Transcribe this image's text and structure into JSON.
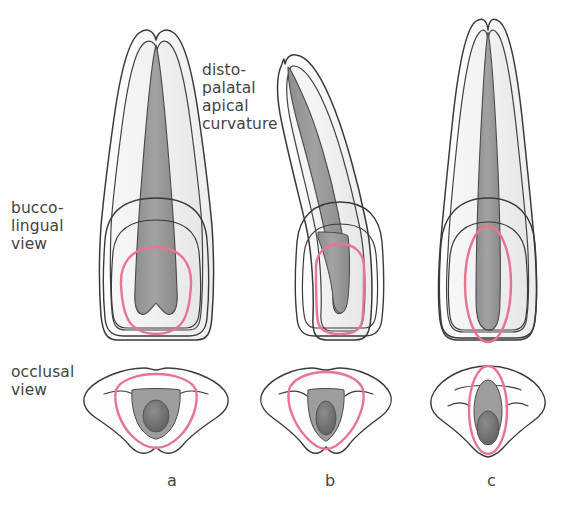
{
  "figure": {
    "background_color": "#ffffff",
    "width": 563,
    "height": 509
  },
  "labels": {
    "bucco_lingual_view": "bucco-\nlingual\nview",
    "occlusal_view": "occlusal\nview",
    "apical_curvature": "disto-\npalatal\napical\ncurvature"
  },
  "panel_letters": {
    "a": "a",
    "b": "b",
    "c": "c"
  },
  "colors": {
    "outline": "#3a3a3a",
    "enamel_fill": "#fbfbfb",
    "dentin_fill": "#f2f2f2",
    "pulp_fill": "#9a9a9a",
    "pulp_dark_fill": "#7d7d7d",
    "access_outline_pink": "#e8758f",
    "text": "#434343",
    "background": "#ffffff"
  },
  "panels": [
    {
      "id": "a",
      "letter": "a",
      "tooth_type": "maxillary central incisor",
      "root_shape": "straight tapering root",
      "pulp_shape": "broad triangular pulp chamber tapering to narrow apical canal",
      "access_outline": "rounded-triangular access cavity",
      "occlusal_outline": "triangular with concave mesial and distal walls",
      "occlusal_pulp": "wide triangular chamber"
    },
    {
      "id": "b",
      "letter": "b",
      "tooth_type": "maxillary incisor with curved root",
      "root_shape": "disto-palatal apical curvature",
      "pulp_shape": "narrow canal following root curvature",
      "access_outline": "narrow rounded-rectangular access cavity",
      "occlusal_outline": "triangular, narrower than a",
      "occlusal_pulp": "narrow triangular chamber"
    },
    {
      "id": "c",
      "letter": "c",
      "tooth_type": "long maxillary incisor",
      "root_shape": "long straight wide root",
      "pulp_shape": "long slender canal extending into crown",
      "access_outline": "narrow elongated oval access cavity",
      "occlusal_outline": "rounded-ovoid outline",
      "occlusal_pulp": "narrow vertical oval chamber"
    }
  ]
}
